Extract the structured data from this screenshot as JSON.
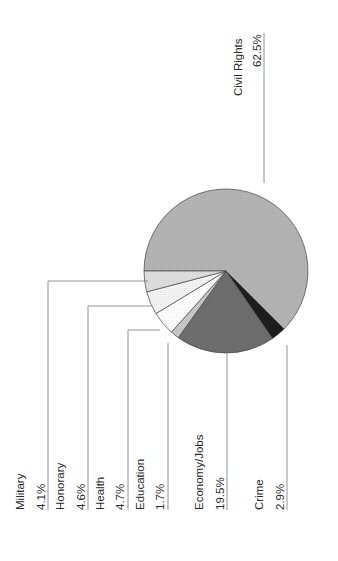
{
  "chart_data": {
    "type": "pie",
    "title": "",
    "orientation": "rotated -90 degrees (labels read bottom-to-top)",
    "categories": [
      "Civil Rights",
      "Crime",
      "Economy/Jobs",
      "Education",
      "Health",
      "Honorary",
      "Military"
    ],
    "values": [
      62.5,
      2.9,
      19.5,
      1.7,
      4.7,
      4.6,
      4.1
    ],
    "value_labels": [
      "62.5%",
      "2.9%",
      "19.5%",
      "1.7%",
      "4.7%",
      "4.6%",
      "4.1%"
    ],
    "colors": [
      "#b4b4b4",
      "#1e1e1e",
      "#6e6e6e",
      "#c8c8c8",
      "#ffffff",
      "#f4f4f4",
      "#dedede"
    ],
    "legend": "none (leader-line labels)"
  },
  "labels": [
    {
      "name": "Civil Rights",
      "value": "62.5%"
    },
    {
      "name": "Military",
      "value": "4.1%"
    },
    {
      "name": "Honorary",
      "value": "4.6%"
    },
    {
      "name": "Health",
      "value": "4.7%"
    },
    {
      "name": "Education",
      "value": "1.7%"
    },
    {
      "name": "Economy/Jobs",
      "value": "19.5%"
    },
    {
      "name": "Crime",
      "value": "2.9%"
    }
  ]
}
